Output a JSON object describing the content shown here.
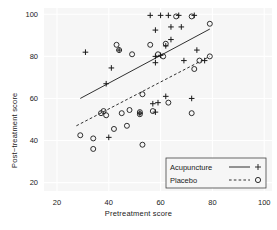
{
  "figure": {
    "type": "scatter-with-fit-lines",
    "background": "#ffffff",
    "panel_background": "#f7f7f7",
    "gridline_color": "#ffffff"
  },
  "axes": {
    "x": {
      "label": "Pretreatment score",
      "ticks": [
        20,
        40,
        60,
        80,
        100
      ],
      "min": 15,
      "max": 103
    },
    "y": {
      "label": "Post−treatment score",
      "ticks": [
        20,
        40,
        60,
        80,
        100
      ],
      "min": 16,
      "max": 103
    }
  },
  "legend": {
    "items": [
      {
        "label": "Acupuncture",
        "line_style": "solid",
        "marker": "plus",
        "color": "#1a1a1a"
      },
      {
        "label": "Placebo",
        "line_style": "dashed",
        "marker": "circle",
        "color": "#1a1a1a"
      }
    ]
  },
  "chart_data": {
    "type": "scatter",
    "title": "",
    "xlabel": "Pretreatment score",
    "ylabel": "Post−treatment score",
    "xlim": [
      15,
      103
    ],
    "ylim": [
      16,
      103
    ],
    "xticks": [
      20,
      40,
      60,
      80,
      100
    ],
    "yticks": [
      20,
      40,
      60,
      80,
      100
    ],
    "grid": true,
    "legend_position": "bottom-right",
    "series": [
      {
        "name": "Acupuncture",
        "marker": "plus",
        "line_style": "solid",
        "points": [
          [
            31,
            82
          ],
          [
            39,
            67
          ],
          [
            41,
            74.5
          ],
          [
            44,
            83
          ],
          [
            40,
            41.5
          ],
          [
            52,
            53
          ],
          [
            56,
            99.5
          ],
          [
            58,
            92.5
          ],
          [
            58,
            80
          ],
          [
            58,
            77
          ],
          [
            60,
            99.5
          ],
          [
            60,
            80.5
          ],
          [
            62,
            85
          ],
          [
            63,
            99.5
          ],
          [
            64,
            94
          ],
          [
            64,
            88
          ],
          [
            62,
            61
          ],
          [
            59,
            58
          ],
          [
            57,
            57.5
          ],
          [
            58,
            53.5
          ],
          [
            67,
            99.5
          ],
          [
            68,
            94
          ],
          [
            69,
            78
          ],
          [
            72,
            60
          ],
          [
            73,
            99.5
          ],
          [
            74,
            83
          ],
          [
            77,
            78
          ]
        ],
        "fit_line": {
          "x": [
            29,
            79
          ],
          "y": [
            60,
            93
          ]
        }
      },
      {
        "name": "Placebo",
        "marker": "circle",
        "line_style": "dashed",
        "points": [
          [
            29,
            42.5
          ],
          [
            34,
            41
          ],
          [
            34,
            36
          ],
          [
            37,
            53
          ],
          [
            38,
            54
          ],
          [
            39,
            52
          ],
          [
            42,
            45.5
          ],
          [
            43,
            85.5
          ],
          [
            44,
            83
          ],
          [
            45,
            53
          ],
          [
            47,
            47
          ],
          [
            48,
            54.5
          ],
          [
            49,
            81
          ],
          [
            52,
            52.5
          ],
          [
            52,
            53.5
          ],
          [
            53,
            62
          ],
          [
            53,
            38
          ],
          [
            56,
            85.5
          ],
          [
            57,
            54
          ],
          [
            59,
            81
          ],
          [
            61,
            80
          ],
          [
            62,
            86
          ],
          [
            63,
            58
          ],
          [
            66,
            99
          ],
          [
            72,
            53
          ],
          [
            73,
            74
          ],
          [
            75,
            78
          ],
          [
            79,
            80
          ],
          [
            79,
            95.5
          ],
          [
            72,
            99
          ]
        ],
        "fit_line": {
          "x": [
            27.5,
            79
          ],
          "y": [
            47,
            80
          ]
        }
      }
    ]
  }
}
